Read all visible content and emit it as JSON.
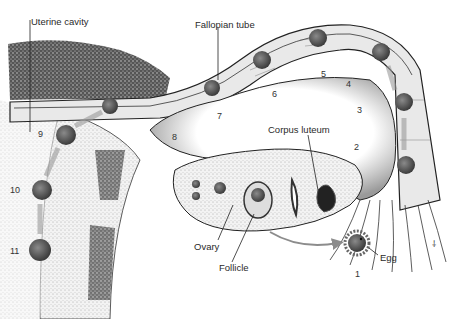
{
  "diagram": {
    "labels": {
      "uterine_cavity": "Uterine cavity",
      "fallopian_tube": "Fallopian tube",
      "corpus_luteum": "Corpus luteum",
      "ovary": "Ovary",
      "follicle": "Follicle",
      "egg": "Egg"
    },
    "stages": [
      "1",
      "2",
      "3",
      "4",
      "5",
      "6",
      "7",
      "8",
      "9",
      "10",
      "11"
    ],
    "signature": "⸸",
    "colors": {
      "ink": "#1e1e1e",
      "stipple_dark": "#3a3a3a",
      "stipple_light": "#b8b8b8",
      "cell_fill": "#6a6a6a",
      "arrow": "#8c8c8c",
      "background": "#ffffff"
    }
  }
}
